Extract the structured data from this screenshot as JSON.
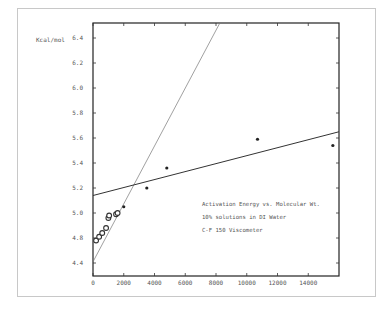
{
  "chart_data": {
    "type": "scatter",
    "title": "Activation Energy vs. Molecular Wt.",
    "annotations": [
      "Activation Energy vs. Molecular Wt.",
      "10% solutions in DI Water",
      "C-F 150 Viscometer"
    ],
    "ylabel": "Kcal/mol",
    "xlabel": "",
    "xlim": [
      0,
      16000
    ],
    "ylim": [
      4.6,
      6.6
    ],
    "x_ticks": [
      {
        "value": 0,
        "label": "0"
      },
      {
        "value": 2000,
        "label": "2000"
      },
      {
        "value": 4000,
        "label": "4000"
      },
      {
        "value": 6000,
        "label": "6000"
      },
      {
        "value": 8000,
        "label": "8000"
      },
      {
        "value": 10000,
        "label": "10000"
      },
      {
        "value": 12000,
        "label": "12000"
      },
      {
        "value": 14000,
        "label": "14000"
      }
    ],
    "y_ticks": [
      {
        "value": 4.6,
        "label": "4.4"
      },
      {
        "value": 4.8,
        "label": "4.8"
      },
      {
        "value": 5.0,
        "label": "5.0"
      },
      {
        "value": 5.2,
        "label": "5.2"
      },
      {
        "value": 5.4,
        "label": "5.4"
      },
      {
        "value": 5.6,
        "label": "5.6"
      },
      {
        "value": 5.8,
        "label": "5.8"
      },
      {
        "value": 6.0,
        "label": "6.0"
      },
      {
        "value": 6.2,
        "label": "6.2"
      },
      {
        "value": 6.4,
        "label": "6.4"
      }
    ],
    "grid": false,
    "series": [
      {
        "name": "low molecular weight (open circles)",
        "marker": "open-circle",
        "points": [
          {
            "x": 200,
            "y": 4.78
          },
          {
            "x": 400,
            "y": 4.81
          },
          {
            "x": 600,
            "y": 4.84
          },
          {
            "x": 850,
            "y": 4.88
          },
          {
            "x": 1000,
            "y": 4.96
          },
          {
            "x": 1050,
            "y": 4.98
          },
          {
            "x": 1500,
            "y": 4.99
          },
          {
            "x": 1600,
            "y": 5.0
          }
        ]
      },
      {
        "name": "high molecular weight (filled points)",
        "marker": "filled-dot",
        "points": [
          {
            "x": 2000,
            "y": 5.05
          },
          {
            "x": 3500,
            "y": 5.2
          },
          {
            "x": 4800,
            "y": 5.36
          },
          {
            "x": 10700,
            "y": 5.59
          },
          {
            "x": 15600,
            "y": 5.54
          }
        ]
      }
    ],
    "fit_lines": [
      {
        "name": "steep fit (low MW)",
        "from": {
          "x": 0,
          "y": 4.61
        },
        "to": {
          "x": 8250,
          "y": 6.52
        }
      },
      {
        "name": "shallow fit (high MW)",
        "from": {
          "x": 0,
          "y": 5.14
        },
        "to": {
          "x": 16000,
          "y": 5.65
        }
      }
    ]
  }
}
